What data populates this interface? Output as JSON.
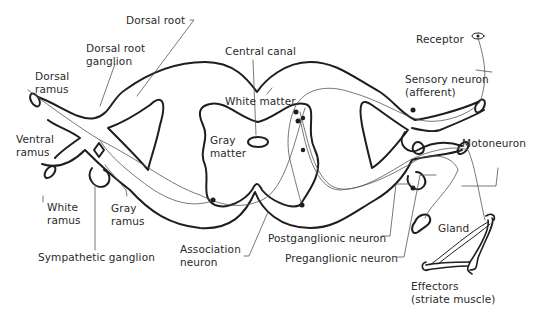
{
  "diagram": {
    "type": "anatomical-diagram",
    "labels": {
      "dorsal_root": "Dorsal root",
      "dorsal_root_ganglion_1": "Dorsal root",
      "dorsal_root_ganglion_2": "ganglion",
      "dorsal_ramus_1": "Dorsal",
      "dorsal_ramus_2": "ramus",
      "ventral_ramus_1": "Ventral",
      "ventral_ramus_2": "ramus",
      "white_ramus_1": "White",
      "white_ramus_2": "ramus",
      "gray_ramus_1": "Gray",
      "gray_ramus_2": "ramus",
      "sympathetic_ganglion": "Sympathetic ganglion",
      "central_canal": "Central canal",
      "white_matter": "White matter",
      "gray_matter_1": "Gray",
      "gray_matter_2": "matter",
      "association_neuron_1": "Association",
      "association_neuron_2": "neuron",
      "postganglionic_neuron": "Postganglionic neuron",
      "preganglionic_neuron": "Preganglionic neuron",
      "receptor": "Receptor",
      "sensory_neuron_1": "Sensory neuron",
      "sensory_neuron_2": "(afferent)",
      "motoneuron": "Motoneuron",
      "gland": "Gland",
      "effectors_1": "Effectors",
      "effectors_2": "(striate muscle)"
    },
    "colors": {
      "outline": "#1e1e1e",
      "pathway": "#555555",
      "text": "#2a2a2a"
    }
  }
}
